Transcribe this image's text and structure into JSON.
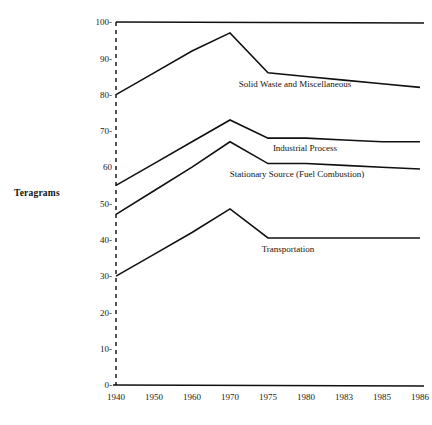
{
  "chart_data": {
    "type": "line",
    "title": "",
    "xlabel": "",
    "ylabel": "Teragrams",
    "categories": [
      "1940",
      "1950",
      "1960",
      "1970",
      "1975",
      "1980",
      "1983",
      "1985",
      "1986"
    ],
    "x": [
      1940,
      1950,
      1960,
      1970,
      1975,
      1980,
      1983,
      1985,
      1986
    ],
    "ylim": [
      0,
      100
    ],
    "yticks": [
      0,
      10,
      20,
      30,
      40,
      50,
      60,
      70,
      80,
      90,
      100
    ],
    "ytick_labels": [
      "0-",
      "10-",
      "20-",
      "30-",
      "40-",
      "50-",
      "60",
      "70-",
      "80-",
      "90-",
      "100-"
    ],
    "grid": false,
    "legend_position": "inline-below-line",
    "series": [
      {
        "name": "Solid Waste and Miscellaneous",
        "label": "Solid Waste and Miscellaneous",
        "values": [
          80,
          86,
          92,
          97,
          86,
          85,
          84,
          83,
          82
        ]
      },
      {
        "name": "Industrial Process",
        "label": "Industrial Process",
        "values": [
          55,
          61,
          67,
          73,
          68,
          68,
          67.5,
          67,
          67
        ]
      },
      {
        "name": "Stationary Source (Fuel Combustion)",
        "label": "Stationary Source (Fuel Combustion)",
        "values": [
          47,
          53.5,
          60,
          67,
          61,
          61,
          60.5,
          60,
          59.5
        ]
      },
      {
        "name": "Transportation",
        "label": "Transportation",
        "values": [
          30,
          36,
          42,
          48.5,
          40.5,
          40.5,
          40.5,
          40.5,
          40.5
        ]
      }
    ]
  },
  "axis": {
    "y_title": "Teragrams",
    "y_tick_labels": [
      "100-",
      "90-",
      "80-",
      "70-",
      "60",
      "50-",
      "40-",
      "30-",
      "20-",
      "10-",
      "0-"
    ],
    "x_tick_labels": [
      "1940",
      "1950",
      "1960",
      "1970",
      "1975",
      "1980",
      "1983",
      "1985",
      "1986"
    ]
  },
  "series_labels": {
    "solid_waste": "Solid Waste and Miscellaneous",
    "industrial_process": "Industrial Process",
    "stationary_source": "Stationary Source (Fuel Combustion)",
    "transportation": "Transportation"
  },
  "colors": {
    "line": "#101010",
    "text": "#1a1a1a",
    "background": "#ffffff"
  }
}
